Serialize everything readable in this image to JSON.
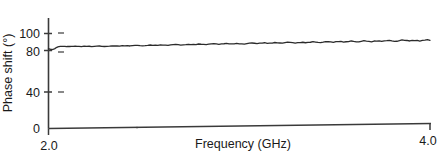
{
  "chart_data": {
    "type": "line",
    "title": "",
    "xlabel": "Frequency (GHz)",
    "ylabel": "Phase shift (°)",
    "xlim": [
      2.0,
      4.0
    ],
    "ylim": [
      0,
      105
    ],
    "grid": false,
    "legend": null,
    "xticks": [
      2.0,
      4.0
    ],
    "xtick_labels": [
      "2.0",
      "4.0"
    ],
    "yticks": [
      0,
      40,
      80,
      100
    ],
    "ytick_labels": [
      "0",
      "40",
      "80",
      "100"
    ],
    "series": [
      {
        "name": "Phase shift",
        "color": "#2b2b2b",
        "x": [
          2.0,
          2.01,
          2.02,
          2.03,
          2.04,
          2.05,
          2.06,
          2.08,
          2.1,
          2.13,
          2.16,
          2.2,
          2.24,
          2.28,
          2.32,
          2.36,
          2.4,
          2.44,
          2.48,
          2.52,
          2.56,
          2.6,
          2.64,
          2.68,
          2.72,
          2.76,
          2.8,
          2.84,
          2.88,
          2.92,
          2.96,
          3.0,
          3.04,
          3.08,
          3.12,
          3.16,
          3.2,
          3.24,
          3.28,
          3.32,
          3.36,
          3.4,
          3.44,
          3.48,
          3.52,
          3.56,
          3.6,
          3.64,
          3.68,
          3.72,
          3.76,
          3.8,
          3.84,
          3.88,
          3.92,
          3.96,
          4.0
        ],
        "y": [
          84.0,
          83.4,
          83.0,
          83.6,
          84.9,
          85.8,
          86.2,
          86.3,
          86.2,
          86.1,
          86.0,
          86.0,
          85.9,
          85.8,
          85.8,
          85.9,
          86.0,
          86.1,
          86.0,
          86.1,
          86.2,
          86.1,
          86.3,
          86.4,
          86.3,
          86.5,
          86.6,
          86.5,
          86.7,
          86.8,
          86.6,
          86.5,
          86.7,
          86.9,
          87.0,
          86.8,
          87.0,
          87.2,
          87.0,
          86.9,
          87.1,
          87.3,
          87.1,
          87.2,
          87.4,
          87.2,
          87.4,
          87.5,
          87.3,
          87.5,
          87.6,
          87.4,
          87.6,
          87.7,
          87.5,
          87.6,
          87.5
        ]
      }
    ]
  },
  "axes": {
    "y_title": "Phase shift (°)",
    "x_title": "Frequency (GHz)",
    "y_labels": [
      "100",
      "80",
      "40",
      "0"
    ],
    "x_labels": [
      "2.0",
      "4.0"
    ]
  }
}
